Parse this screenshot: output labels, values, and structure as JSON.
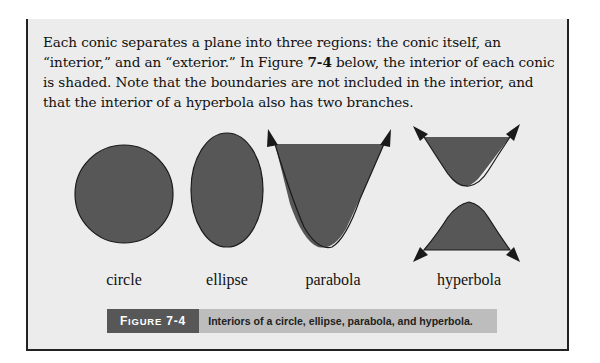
{
  "paragraph": {
    "part1": "Each conic separates a plane into three regions: the conic itself, an “interior,” and an “exterior.” In Figure ",
    "figure_ref": "7-4",
    "part2": " below, the interior of each conic is shaded. Note that the boundaries are not included in the interior, and that the interior of a hyperbola also has two branches."
  },
  "figure": {
    "shapes": [
      {
        "name": "circle",
        "label": "circle"
      },
      {
        "name": "ellipse",
        "label": "ellipse"
      },
      {
        "name": "parabola",
        "label": "parabola"
      },
      {
        "name": "hyperbola",
        "label": "hyperbola"
      }
    ],
    "caption": {
      "tag_first": "F",
      "tag_rest": "IGURE",
      "tag_number": "7-4",
      "text": "Interiors of a circle, ellipse, parabola, and hyperbola."
    },
    "colors": {
      "fill": "#575757",
      "stroke": "#1a1a1a",
      "panel_bg": "#ececec",
      "caption_bg": "#bdbdbd",
      "tag_bg": "#575757"
    }
  }
}
